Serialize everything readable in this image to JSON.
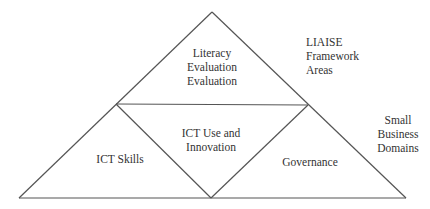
{
  "diagram": {
    "regions": {
      "top": {
        "label": "Literacy\nEvaluation\nEvaluation"
      },
      "bottom_left": {
        "label": "ICT Skills"
      },
      "bottom_center": {
        "label": "ICT Use and\nInnovation"
      },
      "bottom_right": {
        "label": "Governance"
      }
    },
    "annotations": {
      "framework_areas": "LIAISE\nFramework\nAreas",
      "business_domains": "Small\nBusiness\nDomains"
    },
    "colors": {
      "line": "#555555",
      "text": "#333333",
      "background": "#ffffff"
    }
  }
}
